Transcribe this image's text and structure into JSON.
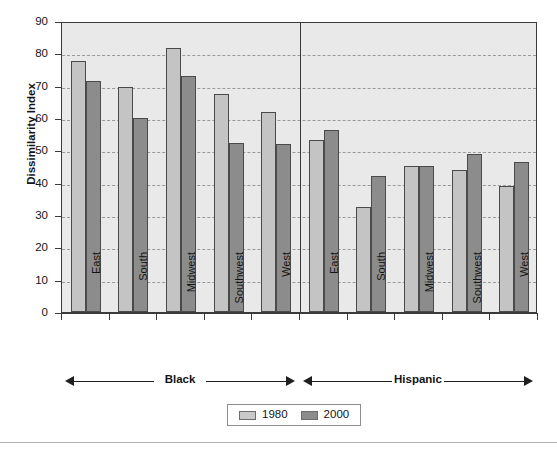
{
  "chart_data": {
    "type": "bar",
    "title": "",
    "xlabel": "",
    "ylabel": "Dissimilarity Index",
    "ylim": [
      0,
      90
    ],
    "ytick_step": 10,
    "yticks": [
      0,
      10,
      20,
      30,
      40,
      50,
      60,
      70,
      80,
      90
    ],
    "grid": true,
    "grid_style": "dashed-horizontal",
    "legend_position": "bottom-center",
    "categories": [
      "East",
      "South",
      "Midwest",
      "Southwest",
      "West",
      "East",
      "South",
      "Midwest",
      "Southwest",
      "West"
    ],
    "groups": [
      {
        "label": "Black",
        "categories": [
          "East",
          "South",
          "Midwest",
          "Southwest",
          "West"
        ]
      },
      {
        "label": "Hispanic",
        "categories": [
          "East",
          "South",
          "Midwest",
          "Southwest",
          "West"
        ]
      }
    ],
    "series": [
      {
        "name": "1980",
        "color": "#c4c4c4",
        "values": [
          77.5,
          69.5,
          81.5,
          67.5,
          61.8,
          53.2,
          32.5,
          45.2,
          43.8,
          39.0
        ]
      },
      {
        "name": "2000",
        "color": "#8c8c8c",
        "values": [
          71.3,
          60.0,
          73.0,
          52.3,
          52.0,
          56.2,
          42.0,
          45.3,
          48.8,
          46.5
        ]
      }
    ]
  },
  "axes": {
    "y_title": "Dissimilarity Index",
    "y_tick_labels": [
      "90",
      "80",
      "70",
      "60",
      "50",
      "40",
      "30",
      "20",
      "10",
      "0"
    ]
  },
  "legend": {
    "items": [
      {
        "label": "1980",
        "swatch": "light-gray-swatch"
      },
      {
        "label": "2000",
        "swatch": "dark-gray-swatch"
      }
    ]
  },
  "brackets": [
    {
      "label": "Black"
    },
    {
      "label": "Hispanic"
    }
  ]
}
